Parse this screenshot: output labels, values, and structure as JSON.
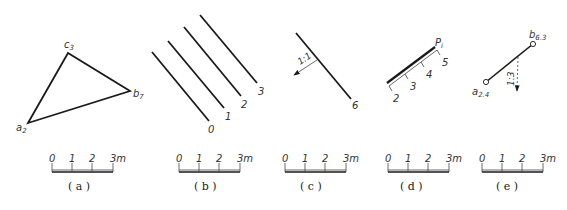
{
  "colors": {
    "line": "#1a1a1a",
    "thin": "#444444",
    "text": "#333333",
    "background": "#ffffff"
  },
  "scale_bar": {
    "ticks": [
      "0",
      "1",
      "2",
      "3m"
    ]
  },
  "panels": [
    {
      "id": "a",
      "caption": "( a )",
      "title": "Triangle with elevation-marked vertices",
      "points": [
        {
          "name": "a",
          "sub": "2",
          "x": 28,
          "y": 123
        },
        {
          "name": "b",
          "sub": "7",
          "x": 130,
          "y": 91
        },
        {
          "name": "c",
          "sub": "3",
          "x": 68,
          "y": 53
        }
      ]
    },
    {
      "id": "b",
      "caption": "( b )",
      "title": "Contour lines",
      "contours": [
        {
          "label": "0",
          "x1": 152,
          "y1": 52,
          "x2": 209,
          "y2": 121
        },
        {
          "label": "1",
          "x1": 168,
          "y1": 41,
          "x2": 224,
          "y2": 108
        },
        {
          "label": "2",
          "x1": 184,
          "y1": 27,
          "x2": 241,
          "y2": 96
        },
        {
          "label": "3",
          "x1": 200,
          "y1": 15,
          "x2": 257,
          "y2": 83
        }
      ]
    },
    {
      "id": "c",
      "caption": "( c )",
      "title": "Contour with slope arrow",
      "contour_label": "6",
      "slope_label": "1:1"
    },
    {
      "id": "d",
      "caption": "( d )",
      "title": "Plane scale line",
      "plane_label": "P",
      "plane_sub": "i",
      "ticks": [
        "2",
        "3",
        "4",
        "5"
      ]
    },
    {
      "id": "e",
      "caption": "( e )",
      "title": "Line with slope",
      "point_a": {
        "name": "a",
        "sub": "2.4"
      },
      "point_b": {
        "name": "b",
        "sub": "6.3"
      },
      "slope_label": "1:3"
    }
  ]
}
